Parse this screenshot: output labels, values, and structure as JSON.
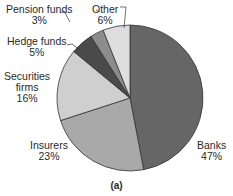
{
  "chart_data": {
    "type": "pie",
    "title": "",
    "caption": "(a)",
    "slices": [
      {
        "name": "Banks",
        "value": 47,
        "color": "#666666"
      },
      {
        "name": "Insurers",
        "value": 23,
        "color": "#a9a9a9"
      },
      {
        "name": "Securities firms",
        "value": 16,
        "color": "#cfcfcf"
      },
      {
        "name": "Hedge funds",
        "value": 5,
        "color": "#4a4a4a"
      },
      {
        "name": "Pension funds",
        "value": 3,
        "color": "#8c8c8c"
      },
      {
        "name": "Other",
        "value": 6,
        "color": "#dedede"
      }
    ],
    "start_angle_deg": 0,
    "direction": "clockwise"
  },
  "labels": {
    "banks": {
      "name": "Banks",
      "pct": "47%"
    },
    "insurers": {
      "name": "Insurers",
      "pct": "23%"
    },
    "securities": {
      "name1": "Securities",
      "name2": "firms",
      "pct": "16%"
    },
    "hedge": {
      "name": "Hedge funds",
      "pct": "5%"
    },
    "pension": {
      "name": "Pension funds",
      "pct": "3%"
    },
    "other": {
      "name": "Other",
      "pct": "6%"
    }
  }
}
